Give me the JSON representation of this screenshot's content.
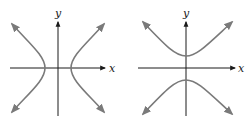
{
  "figures": [
    {
      "name": "horizontal-hyperbola",
      "orientation": "opens left/right",
      "axis_labels": {
        "x": "x",
        "y": "y"
      }
    },
    {
      "name": "vertical-hyperbola",
      "orientation": "opens up/down",
      "axis_labels": {
        "x": "x",
        "y": "y"
      }
    }
  ],
  "colors": {
    "axis": "#1a1a1a",
    "curve": "#7a7a7a",
    "background": "#ffffff"
  }
}
